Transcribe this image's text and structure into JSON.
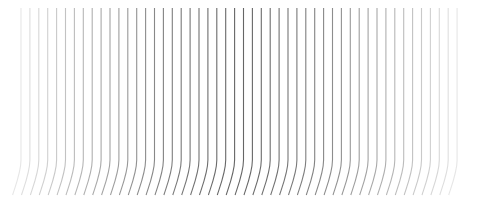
{
  "pattern": {
    "line_count": 50,
    "x_start": 21,
    "spacing": 8.9,
    "y_top": 8,
    "y_bend": 160,
    "y_bottom": 195,
    "stroke_color": "#555555",
    "max_opacity": 0.9,
    "min_opacity": 0.15
  }
}
